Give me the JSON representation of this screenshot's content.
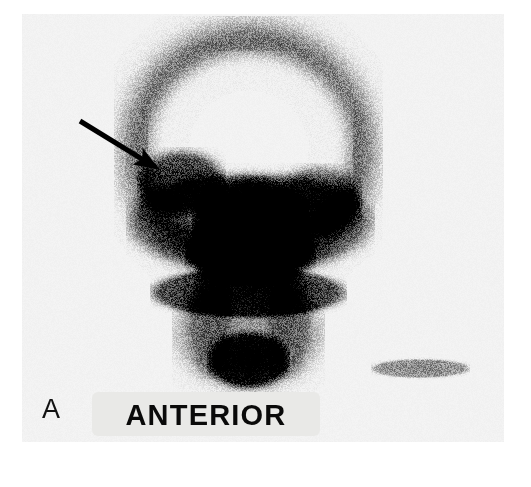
{
  "figure": {
    "panel_letter": "A",
    "orientation_label": "ANTERIOR",
    "modality": "scintigraphy-planar-scan",
    "region": "head-and-neck",
    "background_color": "#ffffff",
    "film_color": "#f3f3f2",
    "label_band_color": "#e9e9e7",
    "ink_color": "#0a0a0a"
  },
  "annotations": {
    "arrow": {
      "name": "lesion-pointer-arrow",
      "color": "#000000",
      "tail_x": 80,
      "tail_y": 121,
      "tip_x": 160,
      "tip_y": 170,
      "shaft_width": 5,
      "head_length": 26,
      "head_width": 19,
      "points_to": "focal-uptake-right-maxilla"
    }
  },
  "chart_data": {
    "type": "heatmap",
    "xlabel": "",
    "ylabel": "",
    "colormap": "grayscale-inverted",
    "value_label": "radiotracer counts (relative)",
    "value_range": [
      0,
      1
    ],
    "grid": false,
    "legend_position": "none",
    "regions": [
      {
        "name": "cranial-vault-rim",
        "shape": "arc-band",
        "cx": 248,
        "cy": 150,
        "rx": 118,
        "ry": 118,
        "intensity": 0.55,
        "blur": 16
      },
      {
        "name": "cranial-vault-center-photopenia",
        "shape": "ellipse",
        "cx": 250,
        "cy": 145,
        "rx": 82,
        "ry": 74,
        "intensity": 0.04,
        "blur": 20
      },
      {
        "name": "focal-uptake-right-maxilla",
        "shape": "ellipse",
        "cx": 181,
        "cy": 182,
        "rx": 33,
        "ry": 24,
        "intensity": 0.86,
        "blur": 11
      },
      {
        "name": "nasal-maxillary-uptake",
        "shape": "ellipse",
        "cx": 250,
        "cy": 225,
        "rx": 48,
        "ry": 40,
        "intensity": 0.97,
        "blur": 10
      },
      {
        "name": "left-maxilla-uptake",
        "shape": "ellipse",
        "cx": 318,
        "cy": 200,
        "rx": 30,
        "ry": 24,
        "intensity": 0.72,
        "blur": 13
      },
      {
        "name": "facial-skeleton-band",
        "shape": "ellipse",
        "cx": 250,
        "cy": 222,
        "rx": 108,
        "ry": 44,
        "intensity": 0.6,
        "blur": 16
      },
      {
        "name": "mandible-band",
        "shape": "ellipse",
        "cx": 248,
        "cy": 292,
        "rx": 86,
        "ry": 22,
        "intensity": 0.85,
        "blur": 12
      },
      {
        "name": "oral-cavity-uptake",
        "shape": "ellipse",
        "cx": 250,
        "cy": 252,
        "rx": 52,
        "ry": 26,
        "intensity": 0.8,
        "blur": 13
      },
      {
        "name": "cervical-soft-tissue",
        "shape": "ellipse",
        "cx": 248,
        "cy": 330,
        "rx": 58,
        "ry": 46,
        "intensity": 0.4,
        "blur": 18
      },
      {
        "name": "thyroid-sternal-notch-uptake",
        "shape": "ellipse",
        "cx": 248,
        "cy": 360,
        "rx": 32,
        "ry": 22,
        "intensity": 1.0,
        "blur": 9
      },
      {
        "name": "reference-marker-stripe",
        "shape": "ellipse",
        "cx": 420,
        "cy": 368,
        "rx": 42,
        "ry": 8,
        "intensity": 0.45,
        "blur": 7
      }
    ]
  }
}
